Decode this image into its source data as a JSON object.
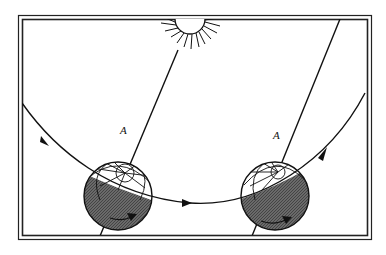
{
  "diagram": {
    "labels": [
      {
        "id": "label-a-left",
        "text": "A",
        "x": 120,
        "y": 124
      },
      {
        "id": "label-a-right",
        "text": "A",
        "x": 273,
        "y": 129
      }
    ],
    "colors": {
      "line": "#111111",
      "night": "#555555",
      "frame": "#222222",
      "background": "#ffffff"
    },
    "elements": [
      "sun-icon",
      "orbit-path",
      "globe-left",
      "globe-right",
      "rotation-arrow-left",
      "rotation-arrow-right",
      "axis-left",
      "axis-right",
      "double-frame"
    ]
  }
}
